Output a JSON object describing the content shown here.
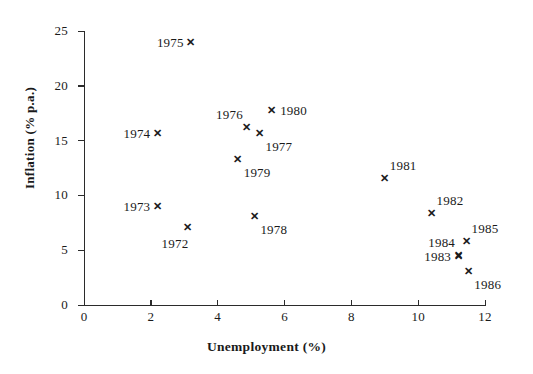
{
  "chart_data": {
    "type": "scatter",
    "title": "",
    "xlabel": "Unemployment (%)",
    "ylabel": "Inflation (% p.a.)",
    "xlim": [
      0,
      12
    ],
    "ylim": [
      0,
      25
    ],
    "xticks": [
      "0",
      "2",
      "4",
      "6",
      "8",
      "10",
      "12"
    ],
    "xtick_values": [
      0,
      2,
      4,
      6,
      8,
      10,
      12
    ],
    "yticks": [
      "0",
      "5",
      "10",
      "15",
      "20",
      "25"
    ],
    "ytick_values": [
      0,
      5,
      10,
      15,
      20,
      25
    ],
    "grid": false,
    "legend": "none",
    "marker": "x",
    "points": [
      {
        "label": "1972",
        "x": 3.1,
        "y": 7.1,
        "label_pos": "below-left"
      },
      {
        "label": "1973",
        "x": 2.2,
        "y": 9.0,
        "label_pos": "left"
      },
      {
        "label": "1974",
        "x": 2.2,
        "y": 15.7,
        "label_pos": "left"
      },
      {
        "label": "1975",
        "x": 3.2,
        "y": 24.0,
        "label_pos": "left"
      },
      {
        "label": "1976",
        "x": 4.85,
        "y": 16.2,
        "label_pos": "above-left"
      },
      {
        "label": "1977",
        "x": 5.25,
        "y": 15.7,
        "label_pos": "below-right"
      },
      {
        "label": "1978",
        "x": 5.1,
        "y": 8.1,
        "label_pos": "below-right"
      },
      {
        "label": "1979",
        "x": 4.6,
        "y": 13.3,
        "label_pos": "below-right"
      },
      {
        "label": "1980",
        "x": 5.6,
        "y": 17.8,
        "label_pos": "right"
      },
      {
        "label": "1981",
        "x": 9.0,
        "y": 11.6,
        "label_pos": "above-right"
      },
      {
        "label": "1982",
        "x": 10.4,
        "y": 8.4,
        "label_pos": "above-right"
      },
      {
        "label": "1983",
        "x": 11.2,
        "y": 4.5,
        "label_pos": "left"
      },
      {
        "label": "1984",
        "x": 11.2,
        "y": 4.6,
        "label_pos": "above-left"
      },
      {
        "label": "1985",
        "x": 11.45,
        "y": 5.8,
        "label_pos": "above-right"
      },
      {
        "label": "1986",
        "x": 11.5,
        "y": 3.1,
        "label_pos": "below-right"
      }
    ]
  },
  "marker_glyph": "✕"
}
